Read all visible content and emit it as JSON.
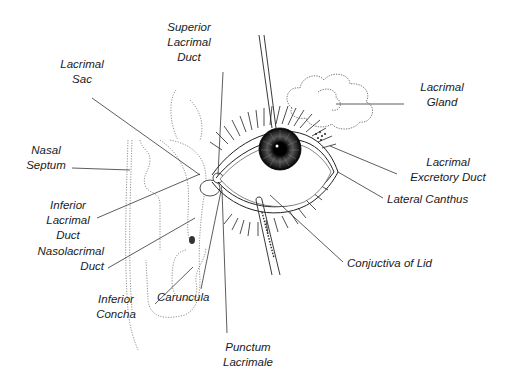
{
  "diagram": {
    "type": "anatomical illustration",
    "colors": {
      "line": "#1a1a1a",
      "background": "#ffffff",
      "iris": "#222222"
    },
    "labels": {
      "superior_lacrimal_duct": {
        "line1": "Superior",
        "line2": "Lacrimal",
        "line3": "Duct"
      },
      "lacrimal_sac": {
        "line1": "Lacrimal",
        "line2": "Sac"
      },
      "lacrimal_gland": {
        "line1": "Lacrimal",
        "line2": "Gland"
      },
      "nasal_septum": {
        "line1": "Nasal",
        "line2": "Septum"
      },
      "lacrimal_excretory_duct": {
        "line1": "Lacrimal",
        "line2": "Excretory Duct"
      },
      "lateral_canthus": {
        "line1": "Lateral Canthus"
      },
      "inferior_lacrimal_duct": {
        "line1": "Inferior",
        "line2": "Lacrimal",
        "line3": "Duct"
      },
      "nasolacrimal_duct": {
        "line1": "Nasolacrimal",
        "line2": "Duct"
      },
      "conjuctiva_of_lid": {
        "line1": "Conjuctiva of Lid"
      },
      "inferior_concha": {
        "line1": "Inferior",
        "line2": "Concha"
      },
      "caruncula": {
        "line1": "Caruncula"
      },
      "punctum_lacrimale": {
        "line1": "Punctum",
        "line2": "Lacrimale"
      }
    }
  }
}
